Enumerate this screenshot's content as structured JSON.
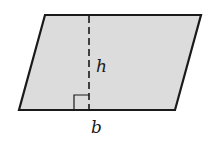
{
  "diagram": {
    "shape": "parallelogram",
    "vertices": [
      [
        45,
        15
      ],
      [
        201,
        15
      ],
      [
        175,
        110
      ],
      [
        19,
        110
      ]
    ],
    "fill_color": "#dcdcdc",
    "stroke_color": "#1a1a1a",
    "height_line": {
      "x": 89,
      "y1": 15,
      "y2": 110,
      "style": "dashed"
    },
    "right_angle_marker": {
      "x": 74,
      "y": 96,
      "size": 15
    },
    "labels": {
      "height": "h",
      "base": "b"
    }
  }
}
